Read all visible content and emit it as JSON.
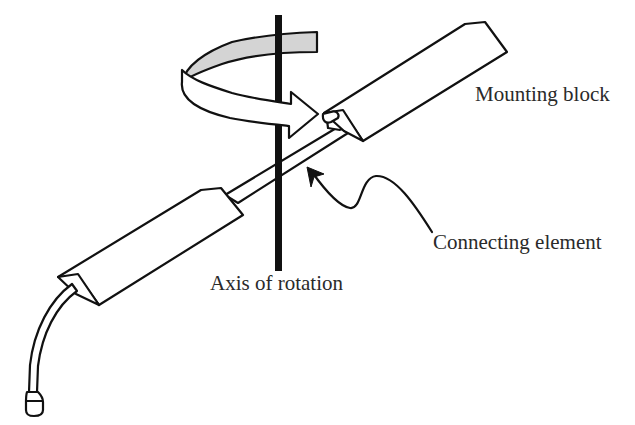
{
  "diagram": {
    "labels": {
      "mounting_block": "Mounting block",
      "connecting_element": "Connecting element",
      "axis_of_rotation": "Axis of rotation"
    },
    "colors": {
      "line": "#111111",
      "band_fill": "#d4d4d4",
      "text": "#2a2a2a",
      "background": "#ffffff"
    }
  }
}
